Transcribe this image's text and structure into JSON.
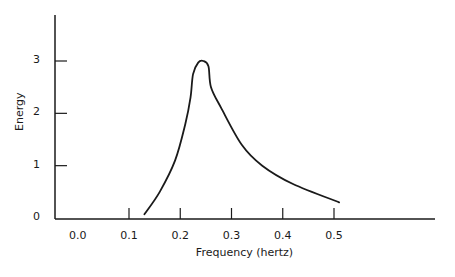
{
  "chart_data": {
    "type": "line",
    "title": "",
    "xlabel": "Frequency (hertz)",
    "ylabel": "Energy",
    "x_ticks": [
      "0.0",
      "0.1",
      "0.2",
      "0.3",
      "0.4",
      "0.5"
    ],
    "y_ticks": [
      "0",
      "1",
      "2",
      "3"
    ],
    "xlim": [
      0.0,
      0.7
    ],
    "ylim": [
      0,
      3.8
    ],
    "grid": false,
    "legend": null,
    "series": [
      {
        "name": "Energy spectrum",
        "x": [
          0.13,
          0.16,
          0.19,
          0.21,
          0.22,
          0.225,
          0.235,
          0.245,
          0.255,
          0.26,
          0.28,
          0.32,
          0.36,
          0.42,
          0.51
        ],
        "y": [
          0.07,
          0.5,
          1.1,
          1.8,
          2.3,
          2.75,
          2.97,
          3.0,
          2.9,
          2.5,
          2.1,
          1.4,
          1.0,
          0.65,
          0.3
        ]
      }
    ]
  }
}
